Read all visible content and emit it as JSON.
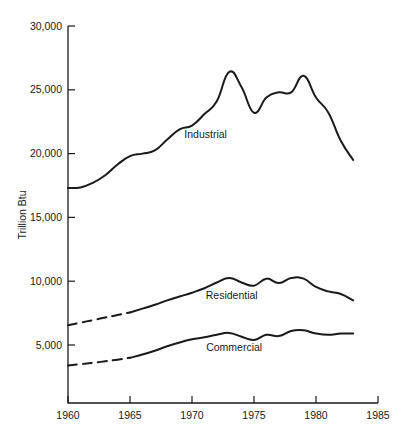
{
  "chart_data": {
    "type": "line",
    "title": "",
    "subtitle": "",
    "xlabel": "",
    "ylabel": "Trillion Btu",
    "xlim": [
      1960,
      1985
    ],
    "ylim": [
      0,
      30000
    ],
    "grid": false,
    "legend_position": "inline-annotations",
    "x_ticks": [
      "1960",
      "1965",
      "1970",
      "1975",
      "1980",
      "1985"
    ],
    "x_tick_values": [
      1960,
      1965,
      1970,
      1975,
      1980,
      1985
    ],
    "y_ticks": [
      "5,000",
      "10,000",
      "15,000",
      "20,000",
      "25,000",
      "30,000"
    ],
    "y_tick_values": [
      5000,
      10000,
      15000,
      20000,
      25000,
      30000
    ],
    "series": [
      {
        "name": "Industrial",
        "style": "solid",
        "label_x": 1971.1,
        "label_y": 21200,
        "x": [
          1960,
          1961,
          1962,
          1963,
          1964,
          1965,
          1966,
          1967,
          1968,
          1969,
          1970,
          1971,
          1972,
          1973,
          1974,
          1975,
          1976,
          1977,
          1978,
          1979,
          1980,
          1981,
          1982,
          1983
        ],
        "values": [
          17300,
          17350,
          17700,
          18300,
          19150,
          19800,
          20000,
          20250,
          21100,
          21900,
          22200,
          23100,
          24100,
          26400,
          25200,
          23200,
          24400,
          24800,
          24800,
          26100,
          24400,
          23200,
          21000,
          19500
        ]
      },
      {
        "name": "Residential",
        "style": "dashed-then-solid",
        "dashed_through": 1965,
        "label_x": 1973.2,
        "label_y": 8600,
        "x": [
          1960,
          1961,
          1962,
          1963,
          1964,
          1965,
          1966,
          1967,
          1968,
          1969,
          1970,
          1971,
          1972,
          1973,
          1974,
          1975,
          1976,
          1977,
          1978,
          1979,
          1980,
          1981,
          1982,
          1983
        ],
        "values": [
          6550,
          6750,
          6950,
          7150,
          7350,
          7550,
          7850,
          8150,
          8500,
          8800,
          9100,
          9450,
          9900,
          10250,
          9900,
          9650,
          10200,
          9850,
          10250,
          10200,
          9550,
          9200,
          9000,
          8500
        ]
      },
      {
        "name": "Commercial",
        "style": "dashed-then-solid",
        "dashed_through": 1965,
        "label_x": 1973.4,
        "label_y": 4500,
        "x": [
          1960,
          1961,
          1962,
          1963,
          1964,
          1965,
          1966,
          1967,
          1968,
          1969,
          1970,
          1971,
          1972,
          1973,
          1974,
          1975,
          1976,
          1977,
          1978,
          1979,
          1980,
          1981,
          1982,
          1983
        ],
        "values": [
          3400,
          3500,
          3600,
          3720,
          3850,
          4000,
          4250,
          4550,
          4900,
          5200,
          5450,
          5600,
          5800,
          5950,
          5650,
          5400,
          5800,
          5700,
          6100,
          6150,
          5900,
          5800,
          5900,
          5900
        ]
      }
    ]
  },
  "axis": {
    "y_title": "Trillion Btu"
  }
}
